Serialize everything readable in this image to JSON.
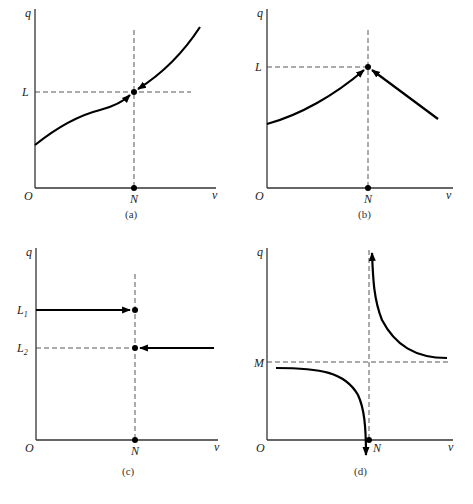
{
  "panels": [
    {
      "id": "a",
      "caption": "(a)",
      "y_axis_label": "q",
      "x_axis_label": "v",
      "origin_label": "O",
      "x_marker_label": "N",
      "y_markers": [
        "L"
      ],
      "description": "Increasing curve; both branches approach point (N, L) with arrows pointing toward it"
    },
    {
      "id": "b",
      "caption": "(b)",
      "y_axis_label": "q",
      "x_axis_label": "v",
      "origin_label": "O",
      "x_marker_label": "N",
      "y_markers": [
        "L"
      ],
      "description": "Left branch rises to (N, L), right branch descends from right toward (N, L); arrows point to the peak"
    },
    {
      "id": "c",
      "caption": "(c)",
      "y_axis_label": "q",
      "x_axis_label": "v",
      "origin_label": "O",
      "x_marker_label": "N",
      "y_markers": [
        "L1",
        "L2"
      ],
      "y_marker_display": [
        "L",
        "L"
      ],
      "y_marker_subscripts": [
        "1",
        "2"
      ],
      "description": "Horizontal line at L1 from left with arrow to N; horizontal line at L2 from right with arrow to N"
    },
    {
      "id": "d",
      "caption": "(d)",
      "y_axis_label": "q",
      "x_axis_label": "v",
      "origin_label": "O",
      "x_marker_label": "N",
      "y_markers": [
        "M"
      ],
      "description": "Left branch starts below M and plunges down toward -infinity at N; right branch descends from +infinity at N toward M asymptotically"
    }
  ]
}
